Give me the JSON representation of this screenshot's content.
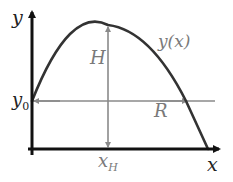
{
  "diagram": {
    "colors": {
      "axis": "#111111",
      "curve": "#333333",
      "guide": "#8a8a8a",
      "label_dark": "#222222",
      "label_gray": "#7a7a7a"
    },
    "labels": {
      "y_axis": "y",
      "x_axis": "x",
      "y0_main": "y",
      "y0_sub": "0",
      "height": "H",
      "curve": "y(x)",
      "range": "R",
      "xH_main": "x",
      "xH_sub": "H"
    }
  }
}
